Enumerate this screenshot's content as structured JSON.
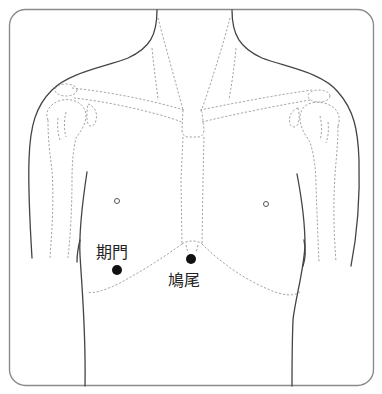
{
  "diagram": {
    "points": [
      {
        "id": "qimen",
        "label": "期門",
        "x": 117,
        "y": 270,
        "label_x": 96,
        "label_y": 258
      },
      {
        "id": "jiuwei",
        "label": "鳩尾",
        "x": 191,
        "y": 259,
        "label_x": 168,
        "label_y": 286
      }
    ],
    "landmarks": [
      {
        "id": "nipple-left",
        "x": 117,
        "y": 201
      },
      {
        "id": "nipple-right",
        "x": 266,
        "y": 204
      }
    ],
    "colors": {
      "frame": "#8a8a8a",
      "outline": "#444444",
      "dashed": "#9a9a9a",
      "point": "#111111"
    }
  }
}
